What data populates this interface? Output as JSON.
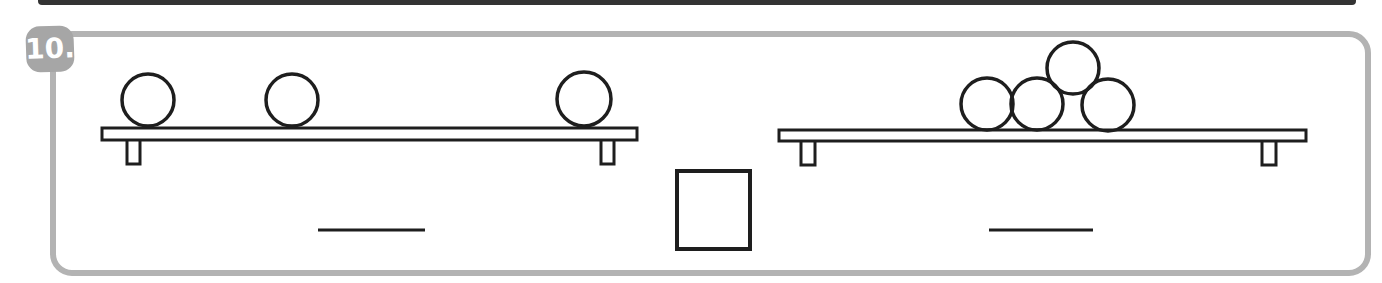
{
  "exercise": {
    "number_label": "10.",
    "left_shelf": {
      "ball_count": 3,
      "answer_line_value": ""
    },
    "right_shelf": {
      "ball_count": 4,
      "answer_line_value": ""
    },
    "comparison_box_value": ""
  },
  "colors": {
    "background": "#ffffff",
    "top_bar": "#333333",
    "panel_border": "#b3b3b3",
    "badge_bg": "#a6a6a6",
    "badge_text": "#ffffff",
    "outline": "#1e1e1e"
  },
  "figure": {
    "left_shelf": {
      "plank": {
        "x": 102,
        "y": 128,
        "w": 535,
        "h": 12
      },
      "legs": [
        {
          "x": 127,
          "y": 139,
          "w": 13,
          "h": 25
        },
        {
          "x": 601,
          "y": 139,
          "w": 13,
          "h": 25
        }
      ],
      "balls": [
        {
          "cx": 148,
          "cy": 100,
          "r": 26
        },
        {
          "cx": 292,
          "cy": 100,
          "r": 26
        },
        {
          "cx": 584,
          "cy": 99,
          "r": 27
        }
      ],
      "answer_line": {
        "x1": 318,
        "y1": 230,
        "x2": 425,
        "y2": 230
      }
    },
    "right_shelf": {
      "plank": {
        "x": 779,
        "y": 130,
        "w": 527,
        "h": 11
      },
      "legs": [
        {
          "x": 801,
          "y": 140,
          "w": 14,
          "h": 25
        },
        {
          "x": 1262,
          "y": 140,
          "w": 14,
          "h": 25
        }
      ],
      "balls": [
        {
          "cx": 1073,
          "cy": 68,
          "r": 26
        },
        {
          "cx": 987,
          "cy": 104,
          "r": 26
        },
        {
          "cx": 1037,
          "cy": 104,
          "r": 26
        },
        {
          "cx": 1108,
          "cy": 105,
          "r": 26
        }
      ],
      "answer_line": {
        "x1": 989,
        "y1": 230,
        "x2": 1093,
        "y2": 230
      }
    },
    "comparison_box": {
      "x": 677,
      "y": 171,
      "w": 73,
      "h": 78
    }
  }
}
